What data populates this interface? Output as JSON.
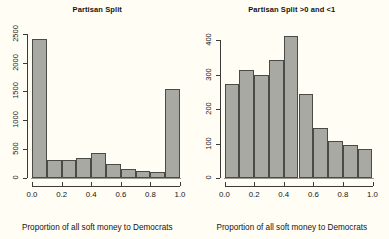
{
  "figure": {
    "background_color": "#fffdf4",
    "bar_fill_color": "#a9a9a3",
    "bar_border_color": "#4a4a47",
    "axis_color": "#3b3b38"
  },
  "panels": [
    {
      "name": "left-panel",
      "title": "Partisan Split",
      "xlabel": "Proportion of all soft money to Democrats",
      "x_ticks": [
        "0.0",
        "0.2",
        "0.4",
        "0.6",
        "0.8",
        "1.0"
      ],
      "y_ticks": [
        "0",
        "500",
        "1000",
        "1500",
        "2000",
        "2500"
      ]
    },
    {
      "name": "right-panel",
      "title": "Partisan Split >0 and <1",
      "xlabel": "Proportion of all soft money to Democrats",
      "x_ticks": [
        "0.0",
        "0.2",
        "0.4",
        "0.6",
        "0.8",
        "1.0"
      ],
      "y_ticks": [
        "0",
        "100",
        "200",
        "300",
        "400"
      ]
    }
  ],
  "chart_data": [
    {
      "type": "bar",
      "subtype": "histogram",
      "panel": "left",
      "title": "Partisan Split",
      "xlabel": "Proportion of all soft money to Democrats",
      "ylabel": "",
      "xlim": [
        0,
        1
      ],
      "ylim": [
        0,
        2600
      ],
      "grid": false,
      "legend": false,
      "bin_edges": [
        0.0,
        0.1,
        0.2,
        0.3,
        0.4,
        0.5,
        0.6,
        0.7,
        0.8,
        0.9,
        1.0
      ],
      "bin_centers": [
        0.05,
        0.15,
        0.25,
        0.35,
        0.45,
        0.55,
        0.65,
        0.75,
        0.85,
        0.95
      ],
      "values": [
        2410,
        320,
        305,
        355,
        425,
        250,
        155,
        115,
        105,
        1545
      ],
      "x_tick_values": [
        0.0,
        0.2,
        0.4,
        0.6,
        0.8,
        1.0
      ],
      "x_tick_labels": [
        "0.0",
        "0.2",
        "0.4",
        "0.6",
        "0.8",
        "1.0"
      ],
      "y_tick_values": [
        0,
        500,
        1000,
        1500,
        2000,
        2500
      ],
      "y_tick_labels": [
        "0",
        "500",
        "1000",
        "1500",
        "2000",
        "2500"
      ]
    },
    {
      "type": "bar",
      "subtype": "histogram",
      "panel": "right",
      "title": "Partisan Split >0 and <1",
      "xlabel": "Proportion of all soft money to Democrats",
      "ylabel": "",
      "xlim": [
        0,
        1
      ],
      "ylim": [
        0,
        430
      ],
      "grid": false,
      "legend": false,
      "bin_edges": [
        0.0,
        0.1,
        0.2,
        0.3,
        0.4,
        0.5,
        0.6,
        0.7,
        0.8,
        0.9,
        1.0
      ],
      "bin_centers": [
        0.05,
        0.15,
        0.25,
        0.35,
        0.45,
        0.55,
        0.65,
        0.75,
        0.85,
        0.95
      ],
      "values": [
        272,
        313,
        298,
        342,
        412,
        245,
        145,
        107,
        97,
        84
      ],
      "x_tick_values": [
        0.0,
        0.2,
        0.4,
        0.6,
        0.8,
        1.0
      ],
      "x_tick_labels": [
        "0.0",
        "0.2",
        "0.4",
        "0.6",
        "0.8",
        "1.0"
      ],
      "y_tick_values": [
        0,
        100,
        200,
        300,
        400
      ],
      "y_tick_labels": [
        "0",
        "100",
        "200",
        "300",
        "400"
      ]
    }
  ]
}
